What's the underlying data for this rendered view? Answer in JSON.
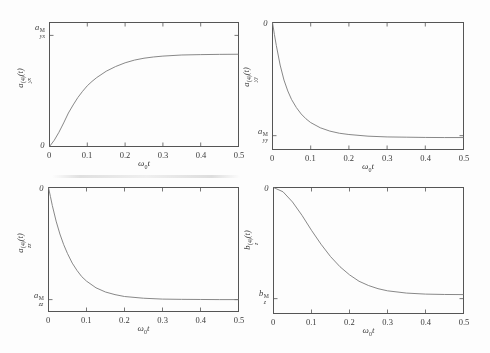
{
  "figure": {
    "background": "#fdfdfd",
    "axis_color": "#555555",
    "line_color": "#7a7a7a",
    "text_color": "#3a3a3a"
  },
  "axis": {
    "xticks": [
      "0",
      "0.1",
      "0.2",
      "0.3",
      "0.4",
      "0.5"
    ],
    "xlabel": {
      "base": "ω",
      "sub": "0",
      "tail": "t"
    }
  },
  "plots": [
    {
      "ylabel": {
        "base": "a",
        "sup": "(4)",
        "sub": "yx",
        "tail": "(t)"
      },
      "tick_upper": {
        "base": "a",
        "sup": "M",
        "sub": "yx"
      },
      "tick_lower": {
        "base": "0",
        "sup": "",
        "sub": ""
      }
    },
    {
      "ylabel": {
        "base": "a",
        "sup": "(4)",
        "sub": "yy",
        "tail": "(t)"
      },
      "tick_upper": {
        "base": "0",
        "sup": "",
        "sub": ""
      },
      "tick_lower": {
        "base": "a",
        "sup": "M",
        "sub": "yy"
      }
    },
    {
      "ylabel": {
        "base": "a",
        "sup": "(4)",
        "sub": "zz",
        "tail": "(t)"
      },
      "tick_upper": {
        "base": "0",
        "sup": "",
        "sub": ""
      },
      "tick_lower": {
        "base": "a",
        "sup": "M",
        "sub": "zz"
      }
    },
    {
      "ylabel": {
        "base": "b",
        "sup": "(4)",
        "sub": "z",
        "tail": "(t)"
      },
      "tick_upper": {
        "base": "0",
        "sup": "",
        "sub": ""
      },
      "tick_lower": {
        "base": "b",
        "sup": "M",
        "sub": "z"
      }
    }
  ],
  "chart_data": {
    "type": "line",
    "layout": "2x2 grid of subplots, scanned journal figure, grayscale",
    "xlabel": "ω₀t",
    "xlim": [
      0,
      0.5
    ],
    "xtick_values": [
      0,
      0.1,
      0.2,
      0.3,
      0.4,
      0.5
    ],
    "note": "y axes have no numeric scale; y_frac is the curve height as fraction of the axis-box height measured up from the bottom edge; ytick_fracs give positions of the two labelled y ticks in the same units",
    "subplots": [
      {
        "position": "top-left",
        "ylabel": "a_yx^(4)(t)",
        "ytick_labels": [
          "a_yx^M",
          "0"
        ],
        "ytick_fracs": [
          0.896,
          0
        ],
        "description": "monotonic rise from 0, saturating at a plateau ≈83% of the a_yx^M tick level",
        "x": [
          0,
          0.0125,
          0.025,
          0.0375,
          0.05,
          0.0625,
          0.075,
          0.0875,
          0.1,
          0.1125,
          0.125,
          0.15,
          0.175,
          0.2,
          0.225,
          0.25,
          0.275,
          0.3,
          0.35,
          0.4,
          0.45,
          0.5
        ],
        "y_frac": [
          0,
          0.05,
          0.115,
          0.19,
          0.27,
          0.335,
          0.395,
          0.445,
          0.49,
          0.525,
          0.556,
          0.607,
          0.645,
          0.675,
          0.697,
          0.712,
          0.722,
          0.729,
          0.738,
          0.741,
          0.743,
          0.744
        ]
      },
      {
        "position": "top-right",
        "ylabel": "a_yy^(4)(t)",
        "ytick_labels": [
          "0",
          "a_yy^M"
        ],
        "ytick_fracs": [
          1,
          0.109
        ],
        "description": "fast exponential-like decay from 0 (top) to asymptote at the a_yy^M level",
        "x": [
          0,
          0.005,
          0.01,
          0.02,
          0.03,
          0.04,
          0.05,
          0.0625,
          0.075,
          0.0875,
          0.1,
          0.125,
          0.15,
          0.175,
          0.2,
          0.25,
          0.3,
          0.35,
          0.4,
          0.45,
          0.5
        ],
        "y_frac": [
          1,
          0.905,
          0.819,
          0.665,
          0.547,
          0.461,
          0.393,
          0.33,
          0.28,
          0.242,
          0.212,
          0.171,
          0.145,
          0.128,
          0.118,
          0.105,
          0.099,
          0.097,
          0.095,
          0.094,
          0.094
        ]
      },
      {
        "position": "bottom-left",
        "ylabel": "a_zz^(4)(t)",
        "ytick_labels": [
          "0",
          "a_zz^M"
        ],
        "ytick_fracs": [
          1,
          0.096
        ],
        "description": "fast exponential-like decay from 0 (top) to asymptote at the a_zz^M level",
        "x": [
          0,
          0.005,
          0.01,
          0.02,
          0.03,
          0.04,
          0.05,
          0.0625,
          0.075,
          0.0875,
          0.1,
          0.125,
          0.15,
          0.175,
          0.2,
          0.25,
          0.3,
          0.35,
          0.4,
          0.45,
          0.5
        ],
        "y_frac": [
          1,
          0.928,
          0.855,
          0.729,
          0.625,
          0.539,
          0.467,
          0.39,
          0.331,
          0.281,
          0.245,
          0.191,
          0.157,
          0.136,
          0.121,
          0.107,
          0.1,
          0.098,
          0.097,
          0.096,
          0.096
        ]
      },
      {
        "position": "bottom-right",
        "ylabel": "b_z^(4)(t)",
        "ytick_labels": [
          "0",
          "b_z^M"
        ],
        "ytick_fracs": [
          1,
          0.118
        ],
        "description": "sigmoidal (Gaussian-like) decay from 0 (top), inflection near ω₀t≈0.12, asymptote slightly above the b_z^M tick",
        "x": [
          0,
          0.025,
          0.05,
          0.075,
          0.1,
          0.125,
          0.15,
          0.175,
          0.2,
          0.225,
          0.25,
          0.275,
          0.3,
          0.35,
          0.4,
          0.45,
          0.5
        ],
        "y_frac": [
          1,
          0.966,
          0.885,
          0.779,
          0.66,
          0.55,
          0.452,
          0.371,
          0.307,
          0.256,
          0.222,
          0.197,
          0.18,
          0.162,
          0.154,
          0.151,
          0.15
        ]
      }
    ]
  }
}
